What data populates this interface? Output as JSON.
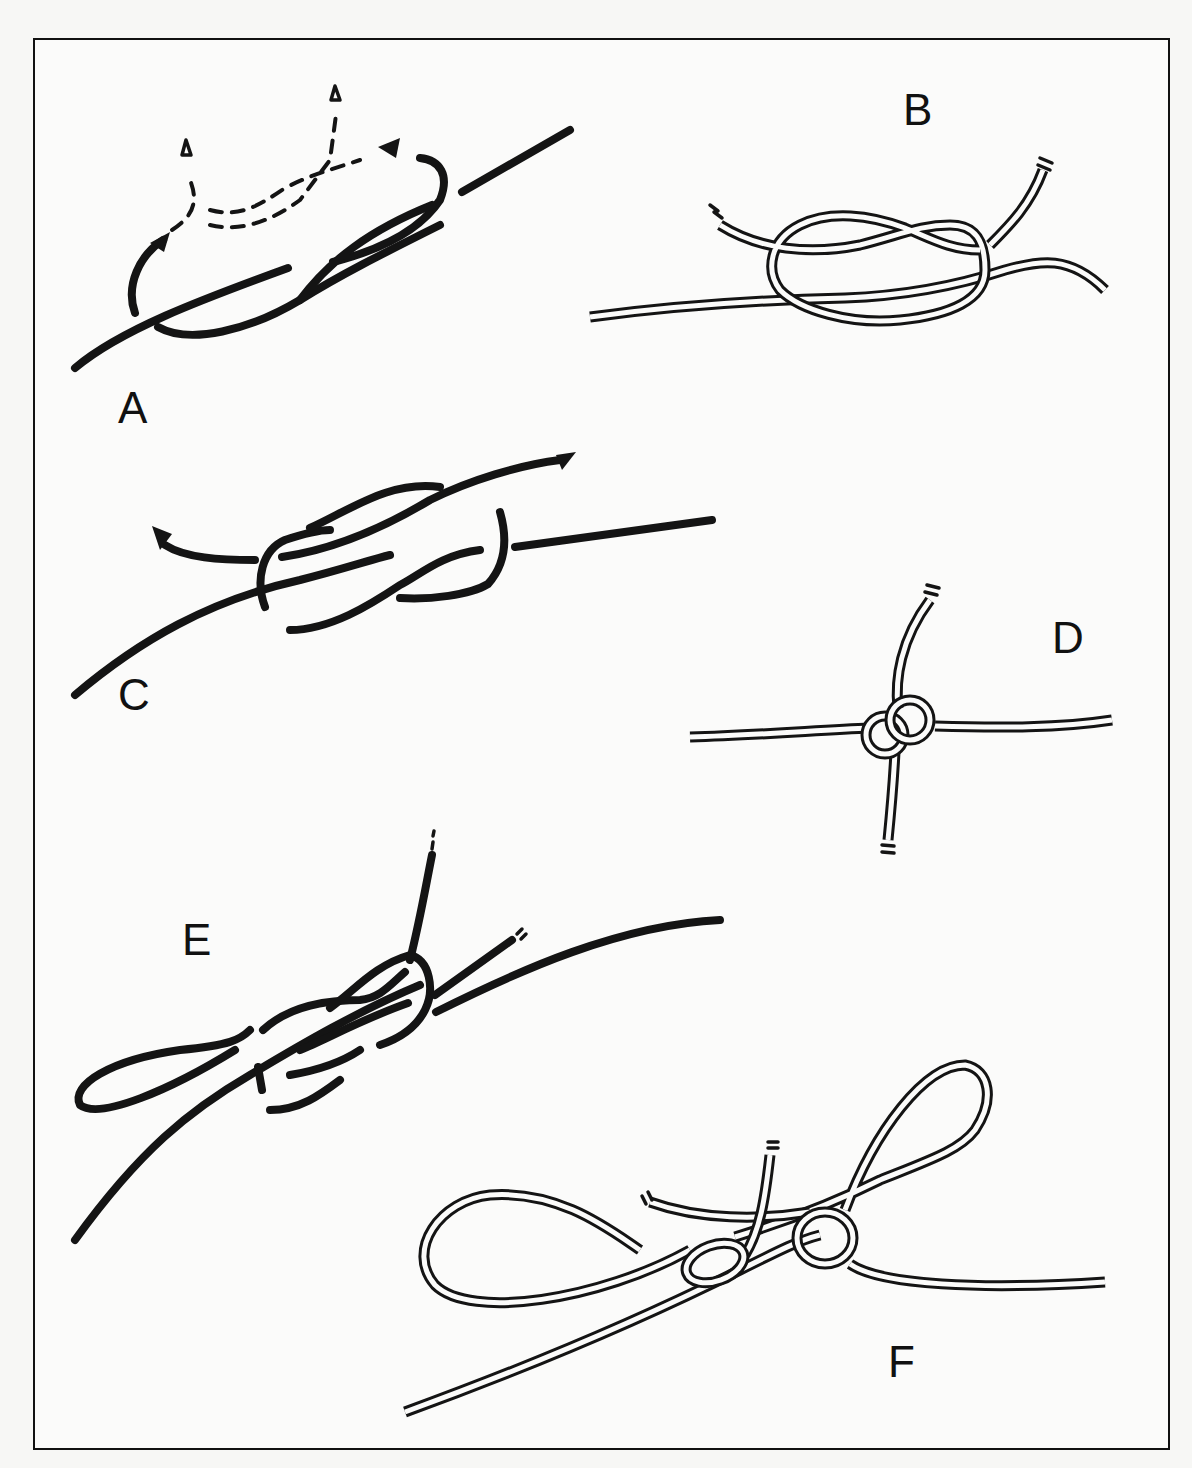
{
  "figure": {
    "colors": {
      "ink": "#141414",
      "paper": "#fbfbfa",
      "frame": "#111111"
    }
  },
  "panels": [
    {
      "id": "A",
      "label": "A",
      "content": "Overhand loop with dashed path arrows showing where the end passes"
    },
    {
      "id": "B",
      "label": "B",
      "content": "Completed figure-eight style knot in double-line cord"
    },
    {
      "id": "C",
      "label": "C",
      "content": "Two strands interlaced with arrows showing pull direction"
    },
    {
      "id": "D",
      "label": "D",
      "content": "Compact crossed knot with four cord ends"
    },
    {
      "id": "E",
      "label": "E",
      "content": "Loop formed through knot with cut ends"
    },
    {
      "id": "F",
      "label": "F",
      "content": "Finished bow with two loops and trailing ends"
    }
  ]
}
